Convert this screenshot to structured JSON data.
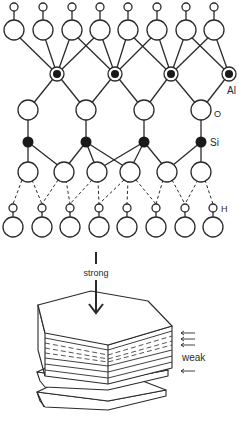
{
  "diagram": {
    "type": "kaolinite-structure-and-cleavage",
    "colors": {
      "ink": "#2a2a2a",
      "fill": "#ffffff",
      "atom_dark": "#1a1a1a"
    },
    "labels": {
      "al": "Al",
      "o": "O",
      "si": "Si",
      "h": "H",
      "strong": "strong",
      "weak": "weak"
    },
    "layers": [
      {
        "name": "hydroxyl-top",
        "count": 8
      },
      {
        "name": "aluminium",
        "count": 4
      },
      {
        "name": "apical-oxygen",
        "count": 4
      },
      {
        "name": "silicon",
        "count": 4
      },
      {
        "name": "basal-oxygen",
        "count": 6
      },
      {
        "name": "hydroxyl-next-layer",
        "count": 8
      }
    ],
    "bonds": {
      "between_layers": "hydrogen bond (dashed)"
    },
    "stack": {
      "strong_arrow": "down",
      "weak_arrows": 4
    }
  }
}
